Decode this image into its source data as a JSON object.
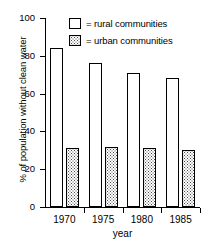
{
  "chart_data": {
    "type": "bar",
    "title": "",
    "subtitle": "",
    "xlabel": "year",
    "ylabel": "% of population without clean water",
    "categories": [
      "1970",
      "1975",
      "1980",
      "1985"
    ],
    "series": [
      {
        "name": "rural communities",
        "values": [
          84,
          76,
          71,
          68
        ],
        "fill": "white",
        "legend_label": "= rural communities"
      },
      {
        "name": "urban communities",
        "values": [
          31,
          32,
          31,
          30
        ],
        "fill": "stippled",
        "legend_label": "= urban communities"
      }
    ],
    "ylim": [
      0,
      100
    ],
    "yticks": [
      0,
      20,
      40,
      60,
      80,
      100
    ],
    "ytick_labels": [
      "0",
      "20",
      "40",
      "60",
      "80",
      "100"
    ],
    "grid": false,
    "legend_position": "top-right-inside",
    "colors": {
      "axis": "#000000",
      "bar_outline": "#000000",
      "rural_fill": "#ffffff",
      "urban_fill": "#ffffff",
      "urban_pattern_dot": "#4a4a4a",
      "background": "#ffffff"
    }
  }
}
